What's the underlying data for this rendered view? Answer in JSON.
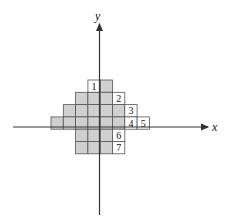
{
  "diagram": {
    "axes": {
      "x_label": "x",
      "y_label": "y"
    },
    "grid": {
      "cell_size": 12.3,
      "shaded_color": "#d0d0d0",
      "rows": [
        {
          "row": 0,
          "shaded_cols": [
            4
          ],
          "numbered": [
            {
              "col": 3,
              "label": "1"
            }
          ]
        },
        {
          "row": 1,
          "shaded_cols": [
            2,
            3,
            4
          ],
          "numbered": [
            {
              "col": 5,
              "label": "2"
            }
          ]
        },
        {
          "row": 2,
          "shaded_cols": [
            1,
            2,
            3,
            4,
            5
          ],
          "numbered": [
            {
              "col": 6,
              "label": "3"
            }
          ]
        },
        {
          "row": 3,
          "shaded_cols": [
            0,
            1,
            2,
            3,
            4,
            5
          ],
          "numbered": [
            {
              "col": 6,
              "label": "4"
            },
            {
              "col": 7,
              "label": "5"
            }
          ]
        },
        {
          "row": 4,
          "shaded_cols": [
            2,
            3,
            4
          ],
          "numbered": [
            {
              "col": 5,
              "label": "6"
            }
          ]
        },
        {
          "row": 5,
          "shaded_cols": [
            2,
            3,
            4
          ],
          "numbered": [
            {
              "col": 5,
              "label": "7"
            }
          ]
        }
      ]
    },
    "labels": [
      "1",
      "2",
      "3",
      "4",
      "5",
      "6",
      "7"
    ]
  }
}
